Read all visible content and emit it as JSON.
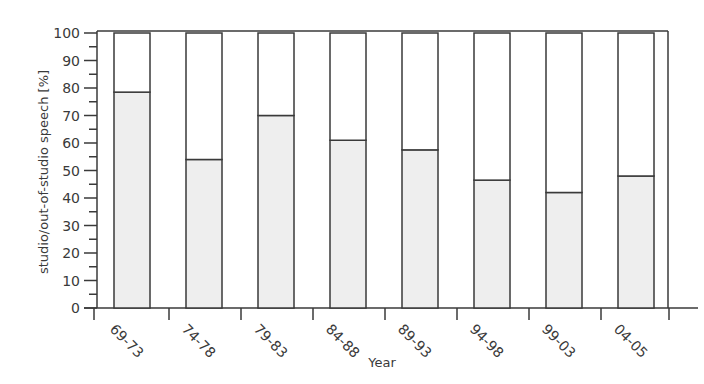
{
  "chart_data": {
    "type": "bar",
    "stacked": true,
    "title": "",
    "xlabel": "Year",
    "ylabel": "studio/out-of-studio speech [%]",
    "ylim": [
      0,
      100
    ],
    "yticks": [
      0,
      10,
      20,
      30,
      40,
      50,
      60,
      70,
      80,
      90,
      100
    ],
    "categories": [
      "69-73",
      "74-78",
      "79-83",
      "84-88",
      "89-93",
      "94-98",
      "99-03",
      "04-05"
    ],
    "series": [
      {
        "name": "studio",
        "color": "#eeeeee",
        "values": [
          78.5,
          54,
          70,
          61,
          57.5,
          46.5,
          42,
          48
        ]
      },
      {
        "name": "out-of-studio",
        "color": "#ffffff",
        "values": [
          21.5,
          46,
          30,
          39,
          42.5,
          53.5,
          58,
          52
        ]
      }
    ],
    "grid": false,
    "legend": "none"
  }
}
